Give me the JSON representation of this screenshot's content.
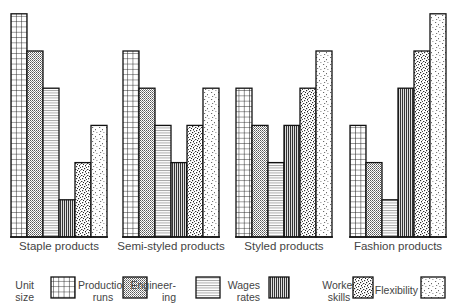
{
  "chart_data": {
    "type": "bar",
    "title": "",
    "xlabel": "",
    "ylabel": "",
    "ylim": [
      0,
      6
    ],
    "grid": false,
    "legend_position": "bottom",
    "categories": [
      "Staple products",
      "Semi-styled products",
      "Styled products",
      "Fashion products"
    ],
    "series": [
      {
        "name": "Unit size",
        "pattern": "grid",
        "values": [
          6,
          5,
          4,
          3
        ]
      },
      {
        "name": "Production runs",
        "pattern": "fine-dots",
        "values": [
          5,
          4,
          3,
          2
        ]
      },
      {
        "name": "Engineering",
        "pattern": "horizontal-lines",
        "values": [
          4,
          3,
          2,
          1
        ]
      },
      {
        "name": "Wages rates",
        "pattern": "vertical-lines",
        "values": [
          1,
          2,
          3,
          4
        ]
      },
      {
        "name": "Worker skills",
        "pattern": "dense-speckle",
        "values": [
          2,
          3,
          4,
          5
        ]
      },
      {
        "name": "Flexibility",
        "pattern": "light-speckle",
        "values": [
          3,
          4,
          5,
          6
        ]
      }
    ]
  },
  "legend": [
    {
      "line1": "Unit",
      "line2": "size"
    },
    {
      "line1": "Production",
      "line2": "runs"
    },
    {
      "line1": "Engineer-",
      "line2": "ing"
    },
    {
      "line1": "Wages",
      "line2": "rates"
    },
    {
      "line1": "Worker",
      "line2": "skills"
    },
    {
      "line1": "Flexibility",
      "line2": ""
    }
  ],
  "colors": {
    "stroke": "#111111",
    "text": "#444444",
    "background": "#ffffff"
  }
}
